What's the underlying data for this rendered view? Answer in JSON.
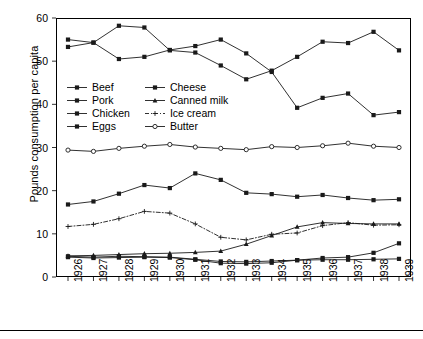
{
  "chart_data": {
    "type": "line",
    "title": "",
    "xlabel": "",
    "ylabel": "Pounds consumption per capita",
    "categories": [
      "1926",
      "1927",
      "1928",
      "1929",
      "1930",
      "1931",
      "1932",
      "1933",
      "1934",
      "1935",
      "1936",
      "1937",
      "1938",
      "1939"
    ],
    "x": [
      1926,
      1927,
      1928,
      1929,
      1930,
      1931,
      1932,
      1933,
      1934,
      1935,
      1936,
      1937,
      1938,
      1939
    ],
    "ylim": [
      0,
      60
    ],
    "xlim": [
      1926,
      1939
    ],
    "yticks": [
      0,
      10,
      20,
      30,
      40,
      50,
      60
    ],
    "grid": false,
    "legend_position": "inside-upper-left",
    "series": [
      {
        "name": "Beef",
        "marker": "filled-square",
        "dash": "solid",
        "values": [
          55.0,
          54.3,
          50.5,
          51.0,
          52.6,
          53.5,
          55.0,
          51.8,
          47.5,
          39.2,
          41.5,
          42.5,
          37.5,
          38.2
        ]
      },
      {
        "name": "Pork",
        "marker": "filled-square",
        "dash": "solid",
        "values": [
          53.3,
          54.3,
          58.2,
          57.8,
          52.5,
          52.0,
          49.0,
          45.8,
          47.8,
          51.0,
          54.5,
          54.2,
          56.8,
          52.5
        ]
      },
      {
        "name": "Chicken",
        "marker": "filled-square",
        "dash": "solid",
        "values": [
          16.8,
          17.5,
          19.3,
          21.3,
          20.6,
          24.0,
          22.5,
          19.5,
          19.2,
          18.6,
          19.0,
          18.3,
          17.8,
          18.0
        ]
      },
      {
        "name": "Eggs",
        "marker": "filled-square",
        "dash": "solid",
        "values": [
          4.6,
          4.4,
          4.5,
          4.6,
          4.5,
          4.0,
          3.2,
          3.1,
          3.3,
          3.9,
          4.4,
          4.6,
          5.6,
          7.8
        ]
      },
      {
        "name": "Cheese",
        "marker": "filled-square",
        "dash": "solid",
        "values": [
          4.8,
          4.6,
          4.8,
          4.7,
          4.6,
          4.1,
          3.6,
          3.5,
          3.7,
          3.9,
          4.0,
          4.0,
          4.1,
          4.2
        ]
      },
      {
        "name": "Canned milk",
        "marker": "filled-triangle",
        "dash": "solid",
        "values": [
          4.9,
          5.0,
          5.2,
          5.4,
          5.5,
          5.7,
          6.0,
          7.6,
          9.6,
          11.6,
          12.6,
          12.4,
          12.3,
          12.3
        ]
      },
      {
        "name": "Ice cream",
        "marker": "plus",
        "dash": "dashdot",
        "values": [
          11.7,
          12.2,
          13.5,
          15.2,
          14.8,
          12.3,
          9.2,
          8.6,
          9.9,
          10.2,
          11.9,
          12.6,
          12.0,
          12.1
        ]
      },
      {
        "name": "Butter",
        "marker": "open-circle",
        "dash": "solid",
        "values": [
          29.4,
          29.1,
          29.8,
          30.3,
          30.7,
          30.1,
          29.8,
          29.5,
          30.2,
          30.0,
          30.4,
          31.0,
          30.3,
          30.0
        ]
      }
    ]
  },
  "legend": {
    "items": [
      {
        "label": "Beef"
      },
      {
        "label": "Cheese"
      },
      {
        "label": "Pork"
      },
      {
        "label": "Canned milk"
      },
      {
        "label": "Chicken"
      },
      {
        "label": "Ice cream"
      },
      {
        "label": "Eggs"
      },
      {
        "label": "Butter"
      }
    ]
  },
  "colors": {
    "line": "#1a1a1a",
    "axis": "#000000",
    "background": "#ffffff"
  }
}
